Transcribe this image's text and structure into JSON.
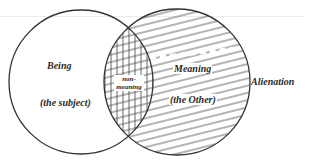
{
  "diagram": {
    "type": "venn",
    "colors": {
      "stroke": "#333333",
      "hatch": "#444444",
      "background": "#ffffff"
    },
    "sets": [
      {
        "id": "left",
        "title": "Being",
        "subtitle": "(the subject)",
        "fill": "none"
      },
      {
        "id": "right",
        "title": "Meaning",
        "subtitle": "(the Other)",
        "fill": "diagonal-hatch"
      }
    ],
    "intersection": {
      "label_line1": "non-",
      "label_line2": "meaning",
      "fill": "cross-hatch"
    },
    "outside_label": "Alienation"
  }
}
